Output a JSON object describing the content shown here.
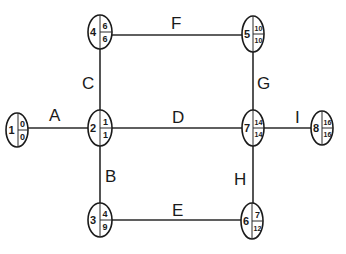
{
  "diagram": {
    "type": "activity-on-arrow network",
    "nodes": [
      {
        "id": "1",
        "top": "0",
        "bottom": "0",
        "cx": 17,
        "cy": 130
      },
      {
        "id": "2",
        "top": "1",
        "bottom": "1",
        "cx": 100,
        "cy": 128
      },
      {
        "id": "3",
        "top": "4",
        "bottom": "9",
        "cx": 100,
        "cy": 220
      },
      {
        "id": "4",
        "top": "6",
        "bottom": "6",
        "cx": 100,
        "cy": 32
      },
      {
        "id": "5",
        "top": "10",
        "bottom": "10",
        "cx": 253,
        "cy": 34
      },
      {
        "id": "6",
        "top": "7",
        "bottom": "12",
        "cx": 252,
        "cy": 221
      },
      {
        "id": "7",
        "top": "14",
        "bottom": "14",
        "cx": 253,
        "cy": 128
      },
      {
        "id": "8",
        "top": "16",
        "bottom": "16",
        "cx": 322,
        "cy": 128
      }
    ],
    "edges": [
      {
        "label": "A",
        "from": "1",
        "to": "2",
        "lx": 55,
        "ly": 121
      },
      {
        "label": "B",
        "from": "2",
        "to": "3",
        "lx": 110,
        "ly": 182
      },
      {
        "label": "C",
        "from": "2",
        "to": "4",
        "lx": 89,
        "ly": 89
      },
      {
        "label": "D",
        "from": "2",
        "to": "7",
        "lx": 178,
        "ly": 123
      },
      {
        "label": "E",
        "from": "3",
        "to": "6",
        "lx": 178,
        "ly": 216
      },
      {
        "label": "F",
        "from": "4",
        "to": "5",
        "lx": 176,
        "ly": 29
      },
      {
        "label": "G",
        "from": "5",
        "to": "7",
        "lx": 263,
        "ly": 89
      },
      {
        "label": "H",
        "from": "7",
        "to": "6",
        "lx": 240,
        "ly": 185
      },
      {
        "label": "I",
        "from": "7",
        "to": "8",
        "lx": 298,
        "ly": 123
      }
    ]
  }
}
